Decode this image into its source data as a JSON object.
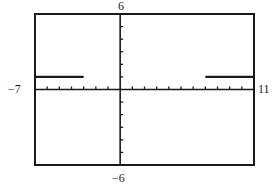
{
  "chart_data": {
    "type": "line",
    "title": "",
    "xlabel": "",
    "ylabel": "",
    "xlim": [
      -7,
      11
    ],
    "ylim": [
      -6,
      6
    ],
    "x_tick_step": 1,
    "y_tick_step": 1,
    "grid": false,
    "legend": null,
    "axis_labels": {
      "xmin": "−7",
      "xmax": "11",
      "ymin": "−6",
      "ymax": "6"
    },
    "series": [
      {
        "name": "segment-left",
        "x": [
          -7,
          -3
        ],
        "y": [
          1,
          1
        ]
      },
      {
        "name": "segment-right",
        "x": [
          7,
          11
        ],
        "y": [
          1,
          1
        ]
      }
    ]
  },
  "colors": {
    "frame": "#1a1a1a",
    "axes": "#1a1a1a",
    "series": "#1a1a1a",
    "background": "#ffffff"
  }
}
